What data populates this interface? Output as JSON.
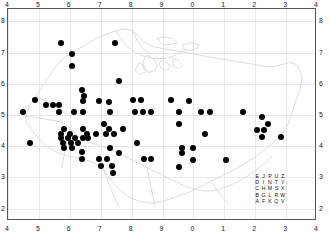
{
  "figure": {
    "type": "distribution-map",
    "background": "#ffffff",
    "frame_color": "#555555",
    "grid_color": "#e8e8e8",
    "coastline_color": "#d4d4d4",
    "dot_color": "#000000"
  },
  "axes": {
    "top_labels": [
      "4",
      "5",
      "6",
      "7",
      "8",
      "9",
      "0",
      "1",
      "2",
      "3",
      "4"
    ],
    "bottom_labels": [
      "4",
      "5",
      "6",
      "7",
      "8",
      "9",
      "0",
      "1",
      "2",
      "3",
      "4"
    ],
    "left_labels": [
      "8",
      "7",
      "6",
      "5",
      "4",
      "3",
      "2"
    ],
    "right_labels": [
      "8",
      "7",
      "6",
      "5",
      "4",
      "3",
      "2"
    ],
    "corner_bottom_left_label": "4",
    "corner_bottom_right_label": "4"
  },
  "legend": {
    "name": "alphabet-square",
    "rows": [
      [
        "E",
        "J",
        "P",
        "U",
        "Z"
      ],
      [
        "D",
        "I",
        "N",
        "T",
        "Y"
      ],
      [
        "C",
        "H",
        "M",
        "S",
        "X"
      ],
      [
        "B",
        "G",
        "L",
        "R",
        "W"
      ],
      [
        "A",
        "F",
        "K",
        "Q",
        "V"
      ]
    ]
  },
  "chart_data": {
    "type": "scatter",
    "title": "",
    "xlabel": "",
    "ylabel": "",
    "xlim": [
      4,
      14
    ],
    "ylim": [
      1.6,
      8.4
    ],
    "xtick_values": [
      4,
      5,
      6,
      7,
      8,
      9,
      10,
      11,
      12,
      13,
      14
    ],
    "xtick_labels": [
      "4",
      "5",
      "6",
      "7",
      "8",
      "9",
      "0",
      "1",
      "2",
      "3",
      "4"
    ],
    "ytick_values": [
      2,
      3,
      4,
      5,
      6,
      7,
      8
    ],
    "ytick_labels": [
      "2",
      "3",
      "4",
      "5",
      "6",
      "7",
      "8"
    ],
    "grid": true,
    "legend_position": "bottom-right",
    "marker": "filled-circle",
    "marker_size_px": 6,
    "n_points": 103,
    "points": [
      [
        5.72,
        7.3
      ],
      [
        7.45,
        7.32
      ],
      [
        6.07,
        6.95
      ],
      [
        6.07,
        6.58
      ],
      [
        7.6,
        6.1
      ],
      [
        6.38,
        5.8
      ],
      [
        6.45,
        5.6
      ],
      [
        4.88,
        5.47
      ],
      [
        6.43,
        5.44
      ],
      [
        6.93,
        5.44
      ],
      [
        7.27,
        5.42
      ],
      [
        8.03,
        5.47
      ],
      [
        8.3,
        5.47
      ],
      [
        9.28,
        5.47
      ],
      [
        9.85,
        5.45
      ],
      [
        5.23,
        5.32
      ],
      [
        5.45,
        5.32
      ],
      [
        5.66,
        5.32
      ],
      [
        4.5,
        5.1
      ],
      [
        5.66,
        5.1
      ],
      [
        6.12,
        5.1
      ],
      [
        6.42,
        5.1
      ],
      [
        7.3,
        5.1
      ],
      [
        8.1,
        5.1
      ],
      [
        8.38,
        5.1
      ],
      [
        8.63,
        5.1
      ],
      [
        9.55,
        5.1
      ],
      [
        10.25,
        5.1
      ],
      [
        10.55,
        5.1
      ],
      [
        11.6,
        5.1
      ],
      [
        12.22,
        4.93
      ],
      [
        7.1,
        4.72
      ],
      [
        9.52,
        4.72
      ],
      [
        12.4,
        4.7
      ],
      [
        5.8,
        4.55
      ],
      [
        6.42,
        4.55
      ],
      [
        7.28,
        4.55
      ],
      [
        7.73,
        4.55
      ],
      [
        12.05,
        4.52
      ],
      [
        12.28,
        4.52
      ],
      [
        5.72,
        4.4
      ],
      [
        6.0,
        4.4
      ],
      [
        6.55,
        4.4
      ],
      [
        6.85,
        4.4
      ],
      [
        7.18,
        4.4
      ],
      [
        7.42,
        4.4
      ],
      [
        10.38,
        4.38
      ],
      [
        5.72,
        4.25
      ],
      [
        5.95,
        4.25
      ],
      [
        6.18,
        4.25
      ],
      [
        6.42,
        4.25
      ],
      [
        6.6,
        4.25
      ],
      [
        12.22,
        4.28
      ],
      [
        12.82,
        4.28
      ],
      [
        4.72,
        4.1
      ],
      [
        5.78,
        4.1
      ],
      [
        6.03,
        4.1
      ],
      [
        6.28,
        4.1
      ],
      [
        8.18,
        4.1
      ],
      [
        5.8,
        3.95
      ],
      [
        6.08,
        3.95
      ],
      [
        7.3,
        3.95
      ],
      [
        9.62,
        3.95
      ],
      [
        9.98,
        3.95
      ],
      [
        6.4,
        3.8
      ],
      [
        7.58,
        3.78
      ],
      [
        9.62,
        3.78
      ],
      [
        6.38,
        3.58
      ],
      [
        6.95,
        3.58
      ],
      [
        7.22,
        3.58
      ],
      [
        8.4,
        3.58
      ],
      [
        8.62,
        3.58
      ],
      [
        9.98,
        3.55
      ],
      [
        11.05,
        3.55
      ],
      [
        7.02,
        3.35
      ],
      [
        7.38,
        3.35
      ],
      [
        9.52,
        3.33
      ],
      [
        7.4,
        3.15
      ]
    ]
  }
}
